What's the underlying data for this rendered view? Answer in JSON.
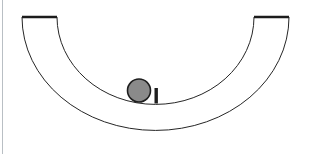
{
  "figure": {
    "title": "Ball resting at the bottom of a semicircular bowl",
    "background_color": "#ffffff",
    "page_edge_color": "#b9bfc4",
    "canvas": {
      "width": 309,
      "height": 154
    }
  },
  "bowl": {
    "name": "semicircular-bowl",
    "stroke_color": "#262626",
    "rim_stroke_color": "#1c1c1c",
    "fill_color": "#ffffff",
    "outer_stroke_width": 1,
    "inner_stroke_width": 1,
    "rim_stroke_width": 2.4,
    "center_x": 155.5,
    "center_y": 18,
    "inner_radius_x": 98,
    "inner_radius_y": 87,
    "outer_radius_x": 133,
    "outer_radius_y": 113,
    "left_rim_outer_x": 22,
    "left_rim_inner_x": 57,
    "right_rim_inner_x": 254,
    "right_rim_outer_x": 289,
    "rim_top_y": 17
  },
  "ball": {
    "name": "ball",
    "fill_color": "#8a8a8a",
    "stroke_color": "#1e1e1e",
    "stroke_width": 1.6,
    "center_x": 139,
    "center_y": 90.5,
    "radius": 11.5
  },
  "post": {
    "name": "post",
    "fill_color": "#1e1e1e",
    "x": 154.5,
    "y": 88,
    "width": 3.4,
    "height": 15.5
  }
}
